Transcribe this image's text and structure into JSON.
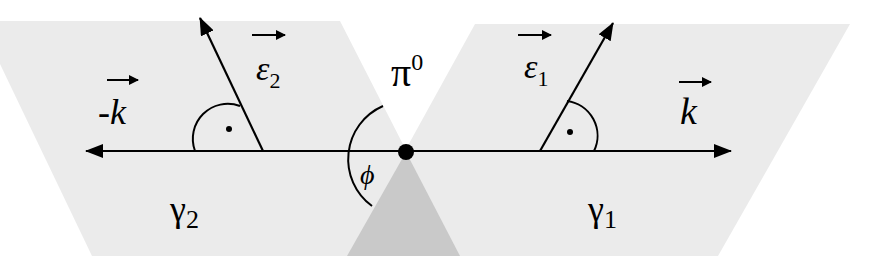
{
  "diagram": {
    "colors": {
      "plane_fill": "#ebebeb",
      "overlap_fill": "#c9c9c9",
      "ink": "#000000",
      "background": "#ffffff"
    },
    "particle": {
      "symbol": "π",
      "superscript": "0"
    },
    "photon_left": {
      "symbol": "γ",
      "subscript": "2"
    },
    "photon_right": {
      "symbol": "γ",
      "subscript": "1"
    },
    "momentum_left": {
      "prefix": "-",
      "symbol": "k"
    },
    "momentum_right": {
      "symbol": "k"
    },
    "polarization_left": {
      "symbol": "ε",
      "subscript": "2"
    },
    "polarization_right": {
      "symbol": "ε",
      "subscript": "1"
    },
    "angle": {
      "symbol": "ϕ"
    },
    "right_angle_markers": [
      "right-angle-left",
      "right-angle-right"
    ]
  }
}
